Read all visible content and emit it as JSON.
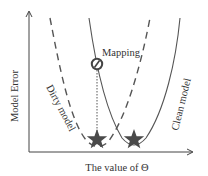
{
  "diagram": {
    "y_axis_label": "Model Error",
    "x_axis_label": "The value of Θ",
    "annotation": "Mapping",
    "curves": [
      {
        "name": "Dirty model",
        "style": "dashed",
        "label": "Dirty model"
      },
      {
        "name": "Clean model",
        "style": "solid",
        "label": "Clean model"
      }
    ],
    "markers": [
      {
        "type": "star",
        "meaning": "dirty-model-minimum"
      },
      {
        "type": "star",
        "meaning": "clean-model-minimum"
      },
      {
        "type": "circle-slash",
        "meaning": "mapping-point"
      }
    ],
    "colors": {
      "axis": "#444444",
      "curve": "#555555",
      "star": "#4a4a4a",
      "text": "#333333"
    }
  }
}
